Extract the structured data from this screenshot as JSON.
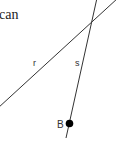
{
  "text_fragment": "can",
  "lines": [
    {
      "label": "r",
      "x1": -2,
      "y1": 108,
      "x2": 118,
      "y2": -2
    },
    {
      "label": "s",
      "x1": 97,
      "y1": -2,
      "x2": 66,
      "y2": 138
    }
  ],
  "point": {
    "label": "B",
    "cx": 69.5,
    "cy": 123.5,
    "r": 3.8
  },
  "colors": {
    "line": "#333333",
    "point": "#000000",
    "text": "#222222"
  }
}
